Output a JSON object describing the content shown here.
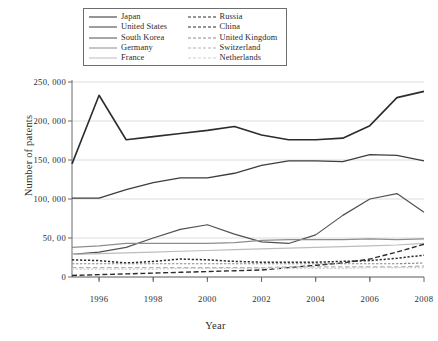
{
  "chart_data": {
    "type": "line",
    "title": "",
    "xlabel": "Year",
    "ylabel": "Number of patents",
    "x": [
      1995,
      1996,
      1997,
      1998,
      1999,
      2000,
      2001,
      2002,
      2003,
      2004,
      2005,
      2006,
      2007,
      2008
    ],
    "xlim": [
      1995,
      2008
    ],
    "ylim": [
      0,
      250000
    ],
    "grid": true,
    "legend_position": "top-center",
    "xticks": [
      1996,
      1998,
      2000,
      2002,
      2004,
      2006,
      2008
    ],
    "xtick_labels": [
      "1996",
      "1998",
      "2000",
      "2002",
      "2004",
      "2006",
      "2008"
    ],
    "yticks": [
      0,
      50000,
      100000,
      150000,
      200000,
      250000
    ],
    "ytick_labels": [
      "0",
      "50, 00",
      "100, 000",
      "150, 000",
      "200, 000",
      "250, 000"
    ],
    "series": [
      {
        "name": "Japan",
        "color": "#2c2c2c",
        "width": 1.6,
        "dash": "",
        "values": [
          145000,
          233000,
          176000,
          180000,
          184000,
          188000,
          193000,
          182000,
          176000,
          176000,
          178000,
          194000,
          230000,
          238000
        ]
      },
      {
        "name": "United States",
        "color": "#3d3d3d",
        "width": 1.3,
        "dash": "",
        "values": [
          101000,
          101000,
          112000,
          121000,
          127000,
          127000,
          133000,
          143000,
          149000,
          149000,
          148000,
          157000,
          156000,
          149000
        ]
      },
      {
        "name": "South Korea",
        "color": "#515151",
        "width": 1.2,
        "dash": "",
        "values": [
          29000,
          32000,
          38000,
          50000,
          61000,
          67000,
          55000,
          45000,
          43000,
          54000,
          79000,
          100000,
          107000,
          83000
        ]
      },
      {
        "name": "Germany",
        "color": "#8d8d8d",
        "width": 1.2,
        "dash": "",
        "values": [
          38000,
          40000,
          43000,
          43000,
          43000,
          43000,
          44000,
          47000,
          48000,
          48000,
          48000,
          49000,
          48000,
          49000
        ]
      },
      {
        "name": "France",
        "color": "#bcbcbc",
        "width": 1.2,
        "dash": "",
        "values": [
          29000,
          30000,
          31000,
          32000,
          33000,
          34000,
          35000,
          36000,
          37000,
          38000,
          39000,
          40000,
          41000,
          43000
        ]
      },
      {
        "name": "Russia",
        "color": "#2b2b2b",
        "width": 1.5,
        "dash": "2.2 1.8",
        "values": [
          22000,
          21000,
          18000,
          20000,
          23000,
          22000,
          20000,
          19000,
          19000,
          19000,
          20000,
          21000,
          24000,
          28000
        ]
      },
      {
        "name": "China",
        "color": "#2b2b2b",
        "width": 1.4,
        "dash": "5 2.6",
        "values": [
          2000,
          3000,
          4000,
          5000,
          6000,
          7000,
          8000,
          9000,
          12000,
          15000,
          18000,
          23000,
          32000,
          42000
        ]
      },
      {
        "name": "United Kingdom",
        "color": "#8a8a8a",
        "width": 1.2,
        "dash": "2.4 1.6",
        "values": [
          17000,
          17000,
          17000,
          17000,
          17000,
          17000,
          17000,
          17000,
          17000,
          17000,
          17000,
          17000,
          17000,
          18000
        ]
      },
      {
        "name": "Switzerland",
        "color": "#b2b2b2",
        "width": 1.2,
        "dash": "4.5 2.5",
        "values": [
          12000,
          12000,
          12000,
          12000,
          12000,
          12000,
          12000,
          12000,
          13000,
          13000,
          13000,
          13000,
          13000,
          14000
        ]
      },
      {
        "name": "Netherlands",
        "color": "#cfcfcf",
        "width": 1.2,
        "dash": "2 1.8",
        "values": [
          10000,
          10000,
          10000,
          10000,
          11000,
          11000,
          11000,
          11000,
          11000,
          11000,
          11000,
          12000,
          12000,
          12000
        ]
      }
    ]
  },
  "legend": {
    "left_column": [
      {
        "label": "Japan"
      },
      {
        "label": "United States"
      },
      {
        "label": "South Korea"
      },
      {
        "label": "Germany"
      },
      {
        "label": "France"
      }
    ],
    "right_column": [
      {
        "label": "Russia"
      },
      {
        "label": "China"
      },
      {
        "label": "United Kingdom"
      },
      {
        "label": "Switzerland"
      },
      {
        "label": "Netherlands"
      }
    ]
  }
}
